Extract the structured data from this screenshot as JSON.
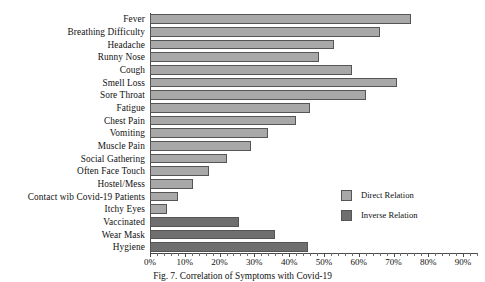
{
  "chart_data": {
    "type": "bar",
    "orientation": "horizontal",
    "title": "",
    "xlabel": "",
    "ylabel": "",
    "xlim": [
      0,
      94
    ],
    "xtick_labels": [
      "0%",
      "10%",
      "20%",
      "30%",
      "40%",
      "50%",
      "60%",
      "70%",
      "80%",
      "90%"
    ],
    "xtick_values": [
      0,
      10,
      20,
      30,
      40,
      50,
      60,
      70,
      80,
      90
    ],
    "minor_tick_step": 2,
    "grid": false,
    "legend_position": "center-right",
    "categories": [
      "Fever",
      "Breathing Difficulty",
      "Headache",
      "Runny Nose",
      "Cough",
      "Smell Loss",
      "Sore Throat",
      "Fatigue",
      "Chest Pain",
      "Vomiting",
      "Muscle Pain",
      "Social Gathering",
      "Often Face Touch",
      "Hostel/Mess",
      "Contact wib Covid-19 Patients",
      "Itchy Eyes",
      "Vaccinated",
      "Wear Mask",
      "Hygiene"
    ],
    "series": [
      {
        "name": "Direct Relation",
        "color": "#a8a8a8",
        "values": [
          75,
          66,
          53,
          48.5,
          58,
          71,
          62,
          46,
          42,
          34,
          29,
          22,
          17,
          12.5,
          8,
          5,
          null,
          null,
          null
        ]
      },
      {
        "name": "Inverse Relation",
        "color": "#6f6f6f",
        "values": [
          null,
          null,
          null,
          null,
          null,
          null,
          null,
          null,
          null,
          null,
          null,
          null,
          null,
          null,
          null,
          null,
          25.5,
          36,
          45.5
        ]
      }
    ],
    "bars": [
      {
        "category": "Fever",
        "value": 75,
        "series": "Direct Relation"
      },
      {
        "category": "Breathing Difficulty",
        "value": 66,
        "series": "Direct Relation"
      },
      {
        "category": "Headache",
        "value": 53,
        "series": "Direct Relation"
      },
      {
        "category": "Runny Nose",
        "value": 48.5,
        "series": "Direct Relation"
      },
      {
        "category": "Cough",
        "value": 58,
        "series": "Direct Relation"
      },
      {
        "category": "Smell Loss",
        "value": 71,
        "series": "Direct Relation"
      },
      {
        "category": "Sore Throat",
        "value": 62,
        "series": "Direct Relation"
      },
      {
        "category": "Fatigue",
        "value": 46,
        "series": "Direct Relation"
      },
      {
        "category": "Chest Pain",
        "value": 42,
        "series": "Direct Relation"
      },
      {
        "category": "Vomiting",
        "value": 34,
        "series": "Direct Relation"
      },
      {
        "category": "Muscle Pain",
        "value": 29,
        "series": "Direct Relation"
      },
      {
        "category": "Social Gathering",
        "value": 22,
        "series": "Direct Relation"
      },
      {
        "category": "Often Face Touch",
        "value": 17,
        "series": "Direct Relation"
      },
      {
        "category": "Hostel/Mess",
        "value": 12.5,
        "series": "Direct Relation"
      },
      {
        "category": "Contact wib Covid-19 Patients",
        "value": 8,
        "series": "Direct Relation"
      },
      {
        "category": "Itchy Eyes",
        "value": 5,
        "series": "Direct Relation"
      },
      {
        "category": "Vaccinated",
        "value": 25.5,
        "series": "Inverse Relation"
      },
      {
        "category": "Wear Mask",
        "value": 36,
        "series": "Inverse Relation"
      },
      {
        "category": "Hygiene",
        "value": 45.5,
        "series": "Inverse Relation"
      }
    ],
    "legend": [
      {
        "label": "Direct Relation",
        "color": "#a8a8a8"
      },
      {
        "label": "Inverse Relation",
        "color": "#6f6f6f"
      }
    ]
  },
  "caption": "Fig. 7. Correlation of Symptoms with Covid-19"
}
